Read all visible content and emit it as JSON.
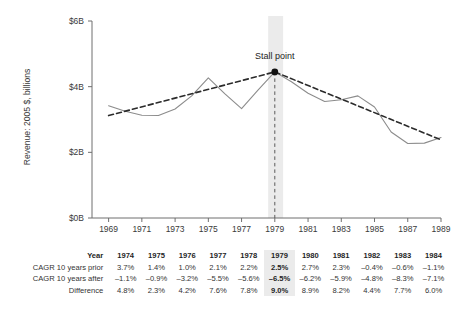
{
  "chart_data": {
    "type": "line",
    "title": "",
    "xlabel": "",
    "ylabel": "Revenue: 2005 $, billions",
    "xlim": [
      1968,
      1989
    ],
    "ylim": [
      0,
      6
    ],
    "ytick_labels": [
      "$0B",
      "$2B",
      "$4B",
      "$6B"
    ],
    "ytick_values": [
      0,
      2,
      4,
      6
    ],
    "xtick_labels": [
      "1969",
      "1971",
      "1973",
      "1975",
      "1977",
      "1979",
      "1981",
      "1983",
      "1985",
      "1987",
      "1989"
    ],
    "xtick_values": [
      1969,
      1971,
      1973,
      1975,
      1977,
      1979,
      1981,
      1983,
      1985,
      1987,
      1989
    ],
    "grid": false,
    "legend": "none",
    "annotations": [
      {
        "label": "Stall point",
        "x": 1979,
        "y": 4.45,
        "marker": "filled-circle"
      }
    ],
    "highlight_band": {
      "x_start": 1978.6,
      "x_end": 1979.5,
      "color": "#ebebeb"
    },
    "series": [
      {
        "name": "Revenue",
        "style": "solid",
        "color": "#8c8c8c",
        "x": [
          1969,
          1970,
          1971,
          1972,
          1973,
          1974,
          1975,
          1976,
          1977,
          1978,
          1979,
          1980,
          1981,
          1982,
          1983,
          1984,
          1985,
          1986,
          1987,
          1988,
          1989
        ],
        "values": [
          3.42,
          3.25,
          3.13,
          3.12,
          3.32,
          3.72,
          4.27,
          3.78,
          3.33,
          3.9,
          4.45,
          4.15,
          3.8,
          3.55,
          3.6,
          3.72,
          3.38,
          2.62,
          2.27,
          2.28,
          2.45
        ]
      },
      {
        "name": "Trend (10-year CAGR prior / after)",
        "style": "dashed",
        "color": "#2b2b2b",
        "x": [
          1969,
          1979,
          1989
        ],
        "values": [
          3.12,
          4.45,
          2.38
        ]
      }
    ]
  },
  "table": {
    "rows": [
      {
        "label": "Year",
        "is_header": true,
        "values": [
          "1974",
          "1975",
          "1976",
          "1977",
          "1978",
          "1979",
          "1980",
          "1981",
          "1982",
          "1983",
          "1984"
        ]
      },
      {
        "label": "CAGR 10 years prior",
        "is_header": false,
        "values": [
          "3.7%",
          "1.4%",
          "1.0%",
          "2.1%",
          "2.2%",
          "2.5%",
          "2.7%",
          "2.3%",
          "–0.4%",
          "–0.6%",
          "–1.1%"
        ]
      },
      {
        "label": "CAGR 10 years after",
        "is_header": false,
        "values": [
          "–1.1%",
          "–0.9%",
          "–3.2%",
          "–5.5%",
          "–5.6%",
          "–6.5%",
          "–6.2%",
          "–5.9%",
          "–4.8%",
          "–8.3%",
          "–7.1%"
        ]
      },
      {
        "label": "Difference",
        "is_header": false,
        "values": [
          "4.8%",
          "2.3%",
          "4.2%",
          "7.6%",
          "7.8%",
          "9.0%",
          "8.9%",
          "8.2%",
          "4.4%",
          "7.7%",
          "6.0%"
        ]
      }
    ],
    "highlight_column_index": 5
  },
  "colors": {
    "series_line": "#8c8c8c",
    "trend_line": "#2b2b2b",
    "axis": "#6f6f6f",
    "highlight_band": "#ebebeb",
    "text": "#333333"
  }
}
